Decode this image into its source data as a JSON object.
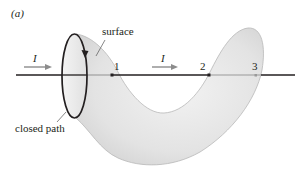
{
  "figure": {
    "panel_label": "(a)",
    "labels": {
      "surface": "surface",
      "closed_path": "closed path"
    },
    "current_labels": {
      "left": "I",
      "middle": "I"
    },
    "points": [
      {
        "id": "1",
        "label": "1"
      },
      {
        "id": "2",
        "label": "2"
      },
      {
        "id": "3",
        "label": "3"
      }
    ],
    "colors": {
      "surface_fill": "#e6e6e6",
      "surface_edge": "#b5b5b5",
      "wire_front": "#231f20",
      "wire_behind": "#9a9a9a",
      "arrow": "#8c8c8c",
      "loop": "#231f20"
    }
  }
}
